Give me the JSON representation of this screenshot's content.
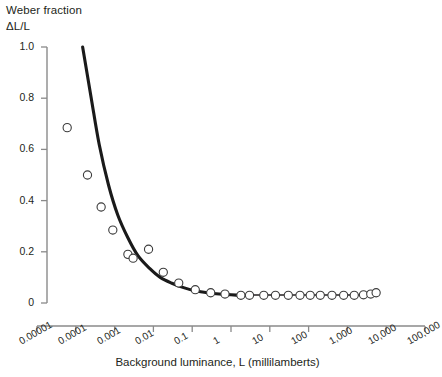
{
  "figure": {
    "title_line1": "Weber fraction",
    "title_line2": "ΔL/L",
    "background": "#ffffff",
    "ink_color": "#231f20"
  },
  "chart_data": {
    "type": "scatter",
    "title": "Weber fraction ΔL/L",
    "xlabel": "Background luminance, L (millilamberts)",
    "ylabel": "Weber fraction ΔL/L",
    "xscale": "log",
    "yscale": "linear",
    "xlim": [
      1e-05,
      100000
    ],
    "ylim": [
      0,
      1.0
    ],
    "grid": false,
    "legend": null,
    "xticks": [
      1e-05,
      0.0001,
      0.001,
      0.01,
      0.1,
      1,
      10,
      100,
      1000,
      10000,
      100000
    ],
    "xticklabels": [
      "0.00001",
      "0.0001",
      "0.001",
      "0.01",
      "0.1",
      "1",
      "10",
      "100",
      "1,000",
      "10,000",
      "100,000"
    ],
    "yticks": [
      0,
      0.2,
      0.4,
      0.6,
      0.8,
      1.0
    ],
    "yticklabels": [
      "0",
      "0.2",
      "0.4",
      "0.6",
      "0.8",
      "1.0"
    ],
    "marker": "open-circle",
    "points": [
      {
        "x": 6e-05,
        "y": 0.685
      },
      {
        "x": 0.0002,
        "y": 0.5
      },
      {
        "x": 0.00045,
        "y": 0.375
      },
      {
        "x": 0.0009,
        "y": 0.285
      },
      {
        "x": 0.0022,
        "y": 0.19
      },
      {
        "x": 0.003,
        "y": 0.175
      },
      {
        "x": 0.0075,
        "y": 0.21
      },
      {
        "x": 0.018,
        "y": 0.12
      },
      {
        "x": 0.045,
        "y": 0.078
      },
      {
        "x": 0.12,
        "y": 0.052
      },
      {
        "x": 0.3,
        "y": 0.04
      },
      {
        "x": 0.7,
        "y": 0.035
      },
      {
        "x": 1.8,
        "y": 0.03
      },
      {
        "x": 3.0,
        "y": 0.03
      },
      {
        "x": 7.0,
        "y": 0.03
      },
      {
        "x": 14,
        "y": 0.03
      },
      {
        "x": 30,
        "y": 0.03
      },
      {
        "x": 60,
        "y": 0.03
      },
      {
        "x": 110,
        "y": 0.03
      },
      {
        "x": 200,
        "y": 0.03
      },
      {
        "x": 400,
        "y": 0.03
      },
      {
        "x": 800,
        "y": 0.03
      },
      {
        "x": 1500,
        "y": 0.03
      },
      {
        "x": 2600,
        "y": 0.032
      },
      {
        "x": 4000,
        "y": 0.035
      },
      {
        "x": 5500,
        "y": 0.04
      }
    ],
    "fit_curve": {
      "label": "fitted Weber curve",
      "x_start": 0.00015,
      "x_end": 2.2,
      "points": [
        {
          "x": 0.00015,
          "y": 1.0
        },
        {
          "x": 0.00025,
          "y": 0.8
        },
        {
          "x": 0.0004,
          "y": 0.62
        },
        {
          "x": 0.0007,
          "y": 0.46
        },
        {
          "x": 0.0012,
          "y": 0.345
        },
        {
          "x": 0.0022,
          "y": 0.255
        },
        {
          "x": 0.004,
          "y": 0.185
        },
        {
          "x": 0.008,
          "y": 0.135
        },
        {
          "x": 0.015,
          "y": 0.1
        },
        {
          "x": 0.03,
          "y": 0.077
        },
        {
          "x": 0.06,
          "y": 0.06
        },
        {
          "x": 0.12,
          "y": 0.048
        },
        {
          "x": 0.25,
          "y": 0.04
        },
        {
          "x": 0.5,
          "y": 0.035
        },
        {
          "x": 1.0,
          "y": 0.032
        },
        {
          "x": 2.2,
          "y": 0.029
        }
      ]
    },
    "tail_connector": {
      "label": "flat tail connecting line",
      "x_start": 1.8,
      "x_end": 5500,
      "y": 0.031
    }
  }
}
